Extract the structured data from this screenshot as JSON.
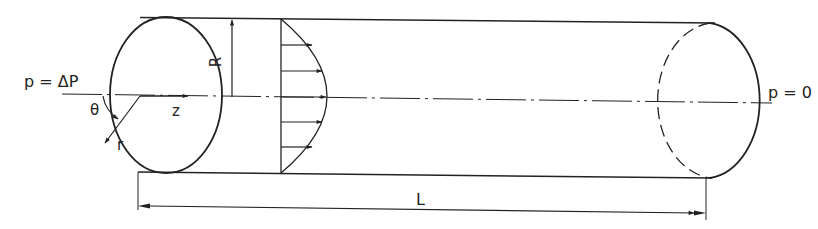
{
  "diagram": {
    "type": "pipe-flow-schematic",
    "colors": {
      "stroke": "#222222",
      "background": "#ffffff"
    },
    "labels": {
      "inlet_pressure": "p = ΔP",
      "outlet_pressure": "p = 0",
      "radius": "R",
      "length": "L",
      "axial_coord": "z",
      "radial_coord": "r",
      "angular_coord": "θ"
    },
    "velocity_profile": {
      "shape": "parabolic",
      "arrow_count": 5
    }
  }
}
